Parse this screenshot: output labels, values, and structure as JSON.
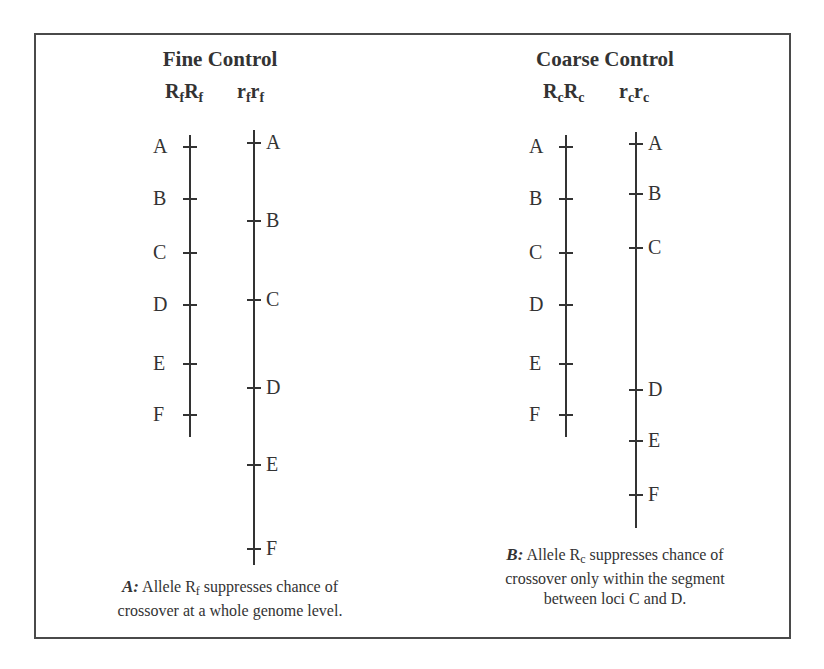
{
  "panels": [
    {
      "id": "fine",
      "title": "Fine Control",
      "genotypes": [
        {
          "base": "R",
          "sub": "f",
          "base2": "R",
          "sub2": "f"
        },
        {
          "base": "r",
          "sub": "f",
          "base2": "r",
          "sub2": "f"
        }
      ],
      "chromosomes": [
        {
          "genotype": "RfRf",
          "label_side": "left",
          "x": 190,
          "top": 135,
          "bottom": 437,
          "loci": [
            {
              "name": "A",
              "y": 146
            },
            {
              "name": "B",
              "y": 198
            },
            {
              "name": "C",
              "y": 252
            },
            {
              "name": "D",
              "y": 304
            },
            {
              "name": "E",
              "y": 363
            },
            {
              "name": "F",
              "y": 414
            }
          ]
        },
        {
          "genotype": "rfrf",
          "label_side": "right",
          "x": 254,
          "top": 130,
          "bottom": 565,
          "loci": [
            {
              "name": "A",
              "y": 142
            },
            {
              "name": "B",
              "y": 220
            },
            {
              "name": "C",
              "y": 299
            },
            {
              "name": "D",
              "y": 387
            },
            {
              "name": "E",
              "y": 464
            },
            {
              "name": "F",
              "y": 548
            }
          ]
        }
      ],
      "caption": {
        "tag": "A:",
        "line1_pre": " Allele R",
        "line1_sub": "f",
        "line1_post": "  suppresses chance of",
        "line2": "crossover at a whole genome level."
      }
    },
    {
      "id": "coarse",
      "title": "Coarse Control",
      "genotypes": [
        {
          "base": "R",
          "sub": "c",
          "base2": "R",
          "sub2": "c"
        },
        {
          "base": "r",
          "sub": "c",
          "base2": "r",
          "sub2": "c"
        }
      ],
      "chromosomes": [
        {
          "genotype": "RcRc",
          "label_side": "left",
          "x": 566,
          "top": 135,
          "bottom": 437,
          "loci": [
            {
              "name": "A",
              "y": 146
            },
            {
              "name": "B",
              "y": 198
            },
            {
              "name": "C",
              "y": 252
            },
            {
              "name": "D",
              "y": 304
            },
            {
              "name": "E",
              "y": 363
            },
            {
              "name": "F",
              "y": 414
            }
          ]
        },
        {
          "genotype": "rcrc",
          "label_side": "right",
          "x": 636,
          "top": 132,
          "bottom": 528,
          "loci": [
            {
              "name": "A",
              "y": 143
            },
            {
              "name": "B",
              "y": 193
            },
            {
              "name": "C",
              "y": 247
            },
            {
              "name": "D",
              "y": 389
            },
            {
              "name": "E",
              "y": 440
            },
            {
              "name": "F",
              "y": 494
            }
          ]
        }
      ],
      "caption": {
        "tag": "B:",
        "line1_pre": " Allele R",
        "line1_sub": "c",
        "line1_post": " suppresses chance of",
        "line2": "crossover only within the segment",
        "line3": "between loci C and D."
      }
    }
  ]
}
